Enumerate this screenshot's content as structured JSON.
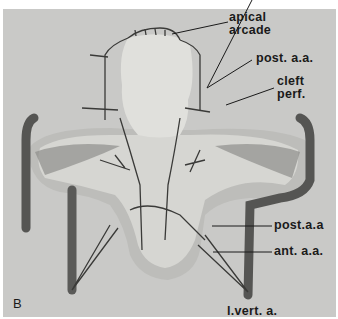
{
  "figure": {
    "panel_label": "B",
    "labels": {
      "apical_arcade_1": "apical",
      "apical_arcade_2": "arcade",
      "post_aa_top": "post. a.a.",
      "cleft_perf_1": "cleft",
      "cleft_perf_2": "perf.",
      "post_aa_bottom": "post.a.a",
      "ant_aa": "ant. a.a.",
      "l_vert_a": "l.vert. a."
    },
    "colors": {
      "background": "#c9c9c7",
      "bone_light": "#dcdcd8",
      "bone_dark": "#8f8f8c",
      "vessel": "#4a4a48",
      "text": "#1a1a1a"
    }
  }
}
